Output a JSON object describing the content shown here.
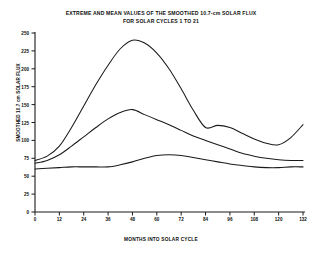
{
  "chart_data": {
    "type": "line",
    "title": "EXTREME AND MEAN VALUES OF THE SMOOTHED 10.7-cm SOLAR FLUX",
    "subtitle": "FOR SOLAR CYCLES 1 TO 21",
    "xlabel": "MONTHS INTO SOLAR CYCLE",
    "ylabel": "SMOOTHED 10.7 cm SOLAR FLUX",
    "xlim": [
      0,
      132
    ],
    "ylim": [
      0,
      250
    ],
    "xticks": [
      0,
      12,
      24,
      36,
      48,
      60,
      72,
      84,
      96,
      108,
      120,
      132
    ],
    "yticks": [
      0,
      25,
      50,
      75,
      100,
      125,
      150,
      175,
      200,
      225,
      250
    ],
    "grid": false,
    "legend": "none",
    "line_color": "#1a1a1a",
    "series": [
      {
        "name": "maximum",
        "x": [
          0,
          6,
          12,
          18,
          24,
          30,
          36,
          42,
          48,
          54,
          60,
          66,
          72,
          78,
          84,
          90,
          96,
          102,
          108,
          114,
          120,
          126,
          132
        ],
        "values": [
          72,
          78,
          92,
          118,
          148,
          178,
          205,
          228,
          240,
          236,
          222,
          200,
          172,
          142,
          118,
          121,
          118,
          110,
          102,
          96,
          94,
          104,
          122
        ]
      },
      {
        "name": "mean",
        "x": [
          0,
          6,
          12,
          18,
          24,
          30,
          36,
          42,
          48,
          54,
          60,
          66,
          72,
          78,
          84,
          90,
          96,
          102,
          108,
          114,
          120,
          126,
          132
        ],
        "values": [
          68,
          72,
          80,
          92,
          105,
          118,
          130,
          139,
          143,
          136,
          129,
          122,
          114,
          106,
          100,
          94,
          88,
          82,
          78,
          75,
          73,
          72,
          72
        ]
      },
      {
        "name": "minimum",
        "x": [
          0,
          6,
          12,
          18,
          24,
          30,
          36,
          42,
          48,
          54,
          60,
          66,
          72,
          78,
          84,
          90,
          96,
          102,
          108,
          114,
          120,
          126,
          132
        ],
        "values": [
          60,
          61,
          62,
          63,
          63,
          63,
          63,
          66,
          70,
          75,
          79,
          80,
          79,
          76,
          73,
          70,
          67,
          65,
          63,
          62,
          62,
          63,
          63
        ]
      }
    ]
  }
}
